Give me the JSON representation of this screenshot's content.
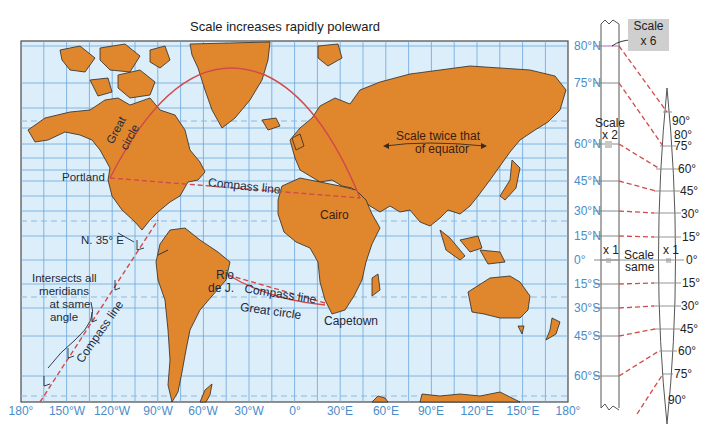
{
  "title": "Scale increases rapidly poleward",
  "colors": {
    "ocean": "#dceefa",
    "land": "#e0872e",
    "land_outline": "#2a2a2a",
    "grid": "#6aa6dc",
    "label_blue": "#4a8cc8",
    "great_circle": "#d24a4a",
    "compass_line": "#d24a4a",
    "scale_box": "#cfcfcf"
  },
  "latitude_labels": [
    "80°N",
    "75°N",
    "60°N",
    "45°N",
    "30°N",
    "15°N",
    "0°",
    "15°S",
    "30°S",
    "45°S",
    "60°S"
  ],
  "longitude_labels": [
    "180°",
    "150°W",
    "120°W",
    "90°W",
    "60°W",
    "30°W",
    "0°",
    "30°E",
    "60°E",
    "90°E",
    "120°E",
    "150°E",
    "180°"
  ],
  "map_labels": {
    "portland": "Portland",
    "great_circle_1": "Great",
    "great_circle_2": "circle",
    "compass_line_north": "Compass line",
    "cairo": "Cairo",
    "scale_twice_1": "Scale twice that",
    "scale_twice_2": "of equator",
    "n35e": "N. 35° E",
    "intersects_1": "Intersects all",
    "intersects_2": "meridians",
    "intersects_3": "at same",
    "intersects_4": "angle",
    "compass_line_diagonal": "Compass line",
    "rio_1": "Rio",
    "rio_2": "de J.",
    "compass_line_south": "Compass line",
    "great_circle_south": "Great circle",
    "capetown": "Capetown"
  },
  "side_diagram": {
    "scale_x6_1": "Scale",
    "scale_x6_2": "x 6",
    "scale_x2_1": "Scale",
    "scale_x2_2": "x 2",
    "x1_left": "x 1",
    "scale_same_1": "Scale",
    "scale_same_2": "same",
    "x1_right": "x 1",
    "globe_labels": [
      "90°",
      "80°",
      "75°",
      "60°",
      "45°",
      "30°",
      "15°",
      "0°",
      "15°",
      "30°",
      "45°",
      "60°",
      "75°",
      "90°"
    ]
  }
}
